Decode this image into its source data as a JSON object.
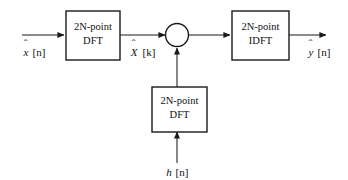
{
  "diagram": {
    "background_color": "#ffffff",
    "line_color": "#1a1a1a",
    "text_color": "#111111",
    "blocks": [
      {
        "id": "input-dft",
        "line1": "2N-point",
        "line2": "DFT"
      },
      {
        "id": "filter-dft",
        "line1": "2N-point",
        "line2": "DFT"
      },
      {
        "id": "output-idft",
        "line1": "2N-point",
        "line2": "IDFT"
      }
    ],
    "signals": {
      "input": {
        "base": "x",
        "hat": "ˆ",
        "index": "[n]",
        "full": "x̂[n]"
      },
      "spectrum": {
        "base": "X",
        "hat": "ˆ",
        "index": "[k]",
        "full": "X̂[k]"
      },
      "filter_input": {
        "base": "h",
        "hat": "",
        "index": "[n]",
        "full": "h[n]"
      },
      "output": {
        "base": "y",
        "hat": "ˆ",
        "index": "[n]",
        "full": "ŷ[n]"
      }
    },
    "junction": {
      "id": "multiplier-node",
      "symbol": "",
      "shape": "circle"
    }
  }
}
